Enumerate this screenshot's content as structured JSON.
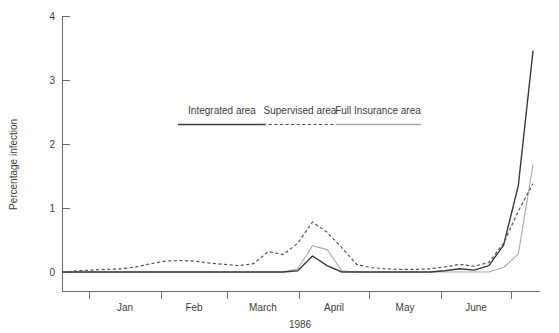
{
  "chart_data": {
    "type": "line",
    "title": "",
    "subtitle": "",
    "xlabel": "1986",
    "ylabel": "Percentage infection",
    "ylim": [
      0,
      4
    ],
    "yticks": [
      0,
      1,
      2,
      3,
      4
    ],
    "ytick_labels": [
      "0",
      "1",
      "2",
      "3",
      "4"
    ],
    "xtick_labels": [
      "Jan",
      "Feb",
      "March",
      "April",
      "May",
      "June"
    ],
    "x_axis_note": "month labels are centred between tick marks",
    "grid": false,
    "legend_position": "upper-center",
    "x": [
      0,
      0.2,
      0.4,
      0.6,
      0.8,
      1.0,
      1.2,
      1.4,
      1.6,
      1.8,
      2.0,
      2.2,
      2.4,
      2.6,
      2.8,
      3.0,
      3.2,
      3.4,
      3.6,
      3.8,
      4.0,
      4.2,
      4.4,
      4.6,
      4.8,
      5.0,
      5.2,
      5.4,
      5.6,
      5.8,
      6.0,
      6.2,
      6.4
    ],
    "series": [
      {
        "name": "Integrated area",
        "style": "solid",
        "color": "#3a3a3a",
        "values": [
          0,
          0,
          0,
          0,
          0,
          0,
          0,
          0,
          0,
          0,
          0,
          0,
          0,
          0,
          0,
          0,
          0.02,
          0.25,
          0.1,
          0,
          0,
          0,
          0,
          0,
          0,
          0,
          0.02,
          0.05,
          0.03,
          0.1,
          0.42,
          1.35,
          3.45
        ]
      },
      {
        "name": "Supervised area",
        "style": "dashed",
        "color": "#555555",
        "values": [
          0,
          0.02,
          0.03,
          0.04,
          0.05,
          0.08,
          0.13,
          0.17,
          0.18,
          0.17,
          0.14,
          0.12,
          0.1,
          0.13,
          0.32,
          0.27,
          0.45,
          0.78,
          0.62,
          0.38,
          0.12,
          0.07,
          0.05,
          0.04,
          0.04,
          0.05,
          0.08,
          0.12,
          0.09,
          0.15,
          0.45,
          0.95,
          1.38
        ]
      },
      {
        "name": "Full Insurance area",
        "style": "solid-light",
        "color": "#a8a8a8",
        "values": [
          0,
          0,
          0,
          0,
          0,
          0,
          0,
          0,
          0,
          0,
          0,
          0,
          0,
          0,
          0,
          0,
          0.05,
          0.41,
          0.35,
          0.02,
          0,
          0,
          0,
          0,
          0,
          0,
          0,
          0,
          0,
          0,
          0.07,
          0.28,
          1.68
        ]
      }
    ]
  },
  "legend": {
    "items": [
      {
        "label": "Integrated area"
      },
      {
        "label": "Supervised area"
      },
      {
        "label": "Full Insurance area"
      }
    ]
  }
}
